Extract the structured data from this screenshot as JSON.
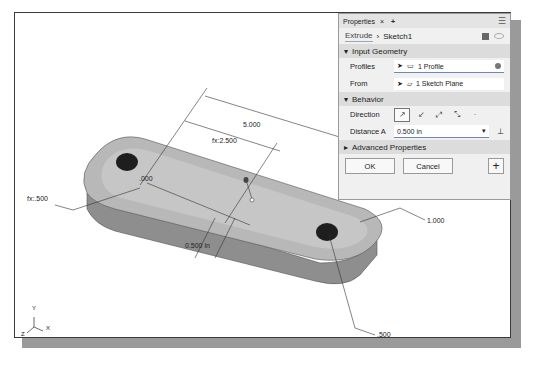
{
  "panel": {
    "title": "Properties",
    "close_glyph": "×",
    "add_glyph": "+",
    "menu_glyph": "☰",
    "breadcrumb": {
      "tab": "Extrude",
      "separator": "›",
      "item": "Sketch1"
    },
    "sections": {
      "input_geometry": "Input Geometry",
      "behavior": "Behavior",
      "advanced": "Advanced Properties"
    },
    "profiles": {
      "label": "Profiles",
      "value": "1 Profile"
    },
    "from": {
      "label": "From",
      "value": "1 Sketch Plane"
    },
    "direction": {
      "label": "Direction"
    },
    "distance": {
      "label": "Distance A",
      "value": "0.500 in"
    },
    "ok_label": "OK",
    "cancel_label": "Cancel",
    "plus_label": "+"
  },
  "dimensions": {
    "overall_length": "5.000",
    "half_length": "fx:2.500",
    "origin": ".000",
    "left_radius": "fx:.500",
    "extrude_distance": "0.500 in",
    "right_radius": "1.000",
    "hole_diameter": ".500"
  },
  "triad": {
    "x": "X",
    "y": "Y",
    "z": "Z"
  }
}
